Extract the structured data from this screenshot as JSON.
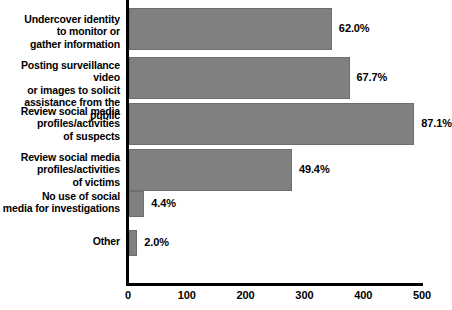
{
  "chart_data": {
    "type": "bar",
    "orientation": "horizontal",
    "title": "",
    "subtitle": "",
    "xlabel": "",
    "ylabel": "",
    "xlim": [
      0,
      500
    ],
    "grid": false,
    "legend": null,
    "bar_color": "#808080",
    "axis_color": "#000000",
    "background": "#ffffff",
    "x_ticks": [
      "0",
      "100",
      "200",
      "300",
      "400",
      "500"
    ],
    "x_tick_values": [
      0,
      100,
      200,
      300,
      400,
      500
    ],
    "categories": [
      "Undercover identity\nto monitor or\ngather information",
      "Posting surveillance video\nor images to solicit\nassistance from the public",
      "Review social media\nprofiles/activities\nof suspects",
      "Review social media\nprofiles/activities\nof victims",
      "No use of social\nmedia for investigations",
      "Other"
    ],
    "values": [
      345,
      375,
      485,
      277,
      26,
      14
    ],
    "data_labels": [
      "62.0%",
      "67.7%",
      "87.1%",
      "49.4%",
      "4.4%",
      "2.0%"
    ],
    "percents": [
      62.0,
      67.7,
      87.1,
      49.4,
      4.4,
      2.0
    ]
  },
  "bars": [
    {
      "label": "Undercover identity\nto monitor or\ngather information",
      "value": 345,
      "data_label": "62.0%",
      "label_top": 13,
      "bar_top": 8,
      "bar_height": 42
    },
    {
      "label": "Posting surveillance video\nor images to solicit\nassistance from the public",
      "value": 375,
      "data_label": "67.7%",
      "label_top": 59,
      "bar_top": 57,
      "bar_height": 42
    },
    {
      "label": "Review social media\nprofiles/activities\nof suspects",
      "value": 485,
      "data_label": "87.1%",
      "label_top": 105,
      "bar_top": 103,
      "bar_height": 42
    },
    {
      "label": "Review social media\nprofiles/activities\nof victims",
      "value": 277,
      "data_label": "49.4%",
      "label_top": 151,
      "bar_top": 149,
      "bar_height": 42
    },
    {
      "label": "No use of social\nmedia for investigations",
      "value": 26,
      "data_label": "4.4%",
      "label_top": 190,
      "bar_top": 191,
      "bar_height": 26
    },
    {
      "label": "Other",
      "value": 14,
      "data_label": "2.0%",
      "label_top": 235,
      "bar_top": 230,
      "bar_height": 26
    }
  ]
}
